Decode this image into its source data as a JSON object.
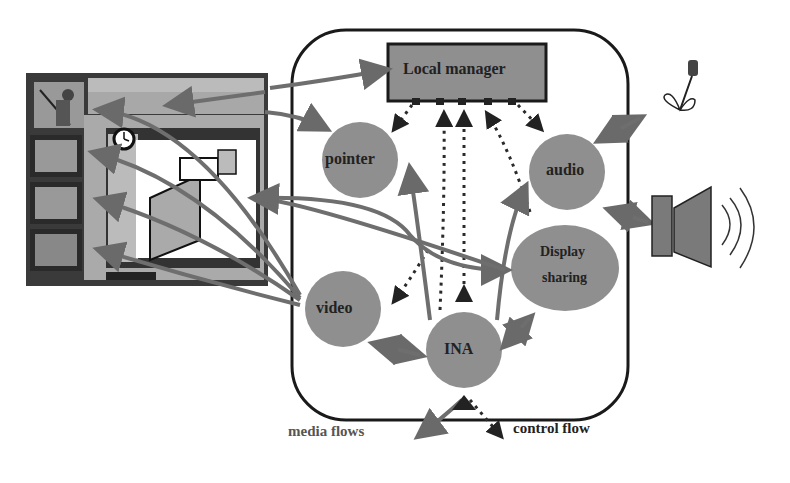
{
  "nodes": {
    "local_manager": "Local manager",
    "pointer": "pointer",
    "audio": "audio",
    "display_sharing_1": "Display",
    "display_sharing_2": "sharing",
    "video": "video",
    "ina": "INA"
  },
  "legend": {
    "media": "media flows",
    "control": "control flow"
  },
  "colors": {
    "node_fill": "#8f8f8f",
    "media_arrow": "#6e6e6e",
    "control_arrow": "#2a2a2a",
    "border": "#1a1a1a"
  }
}
